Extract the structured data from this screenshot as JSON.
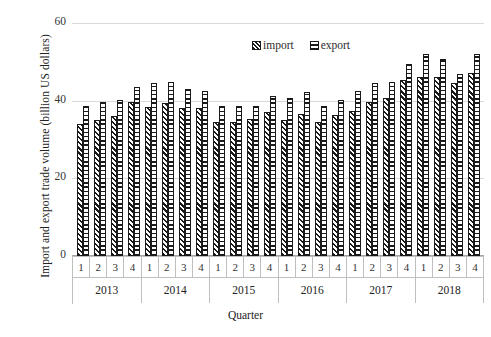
{
  "chart_data": {
    "type": "bar",
    "title": "",
    "xlabel": "Quarter",
    "ylabel": "Import and export trade volume (billion US dollars)",
    "ylim": [
      0,
      60
    ],
    "yticks": [
      0,
      20,
      40,
      60
    ],
    "ytick_labels": [
      "0",
      "20",
      "40",
      "60"
    ],
    "grid": true,
    "legend_position": "top-center",
    "categories": [
      "1",
      "2",
      "3",
      "4",
      "1",
      "2",
      "3",
      "4",
      "1",
      "2",
      "3",
      "4",
      "1",
      "2",
      "3",
      "4",
      "1",
      "2",
      "3",
      "4",
      "1",
      "2",
      "3",
      "4"
    ],
    "groups": [
      {
        "year": "2013",
        "quarters": [
          "1",
          "2",
          "3",
          "4"
        ]
      },
      {
        "year": "2014",
        "quarters": [
          "1",
          "2",
          "3",
          "4"
        ]
      },
      {
        "year": "2015",
        "quarters": [
          "1",
          "2",
          "3",
          "4"
        ]
      },
      {
        "year": "2016",
        "quarters": [
          "1",
          "2",
          "3",
          "4"
        ]
      },
      {
        "year": "2017",
        "quarters": [
          "1",
          "2",
          "3",
          "4"
        ]
      },
      {
        "year": "2018",
        "quarters": [
          "1",
          "2",
          "3",
          "4"
        ]
      }
    ],
    "series": [
      {
        "name": "import",
        "pattern": "diagonal-hatch",
        "values": [
          34.0,
          35.0,
          36.0,
          39.7,
          38.3,
          39.4,
          38.2,
          38.0,
          34.4,
          34.5,
          35.2,
          37.1,
          35.0,
          36.5,
          34.6,
          36.2,
          37.4,
          39.6,
          40.8,
          45.4,
          46.2,
          46.0,
          44.6,
          47.0
        ]
      },
      {
        "name": "export",
        "pattern": "horizontal-hatch",
        "values": [
          38.7,
          39.6,
          40.1,
          43.5,
          44.5,
          44.8,
          43.1,
          42.4,
          38.6,
          38.6,
          38.6,
          41.1,
          40.7,
          42.2,
          38.6,
          40.3,
          42.6,
          44.6,
          44.9,
          49.5,
          52.0,
          50.8,
          46.9,
          52.0
        ]
      }
    ],
    "legend": [
      {
        "label": "import",
        "pattern": "diagonal-hatch"
      },
      {
        "label": "export",
        "pattern": "horizontal-hatch"
      }
    ],
    "colors": {
      "bar_outline": "#1a1a1a",
      "bar_fill": "#ffffff",
      "gridline": "#d9d9d9",
      "axis_line": "#bfbfbf",
      "text": "#222222"
    }
  }
}
